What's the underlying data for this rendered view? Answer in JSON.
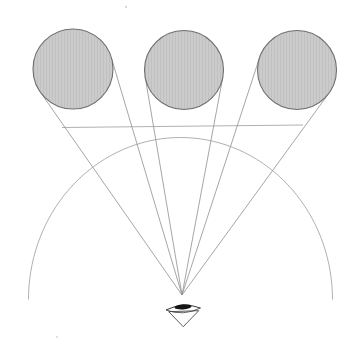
{
  "diagram": {
    "name": "visual-angle-perspective-diagram",
    "canvas": {
      "width": 360,
      "height": 354,
      "background": "#ffffff"
    },
    "colors": {
      "sphere_fill": "#cbcbcb",
      "sphere_texture": "#c1c1c1",
      "sphere_stroke": "#6e6e6e",
      "sight_line": "#8f8f8f",
      "picture_plane_line": "#9c9c9c",
      "arc_line": "#9c9c9c",
      "eye_stroke": "#3a3a3a",
      "cone_stroke": "#4a4a4a",
      "pupil_fill": "#151515",
      "speck": "#d8d8d8"
    },
    "spheres": [
      {
        "cx": 73,
        "cy": 69,
        "r": 40
      },
      {
        "cx": 184,
        "cy": 70,
        "r": 39.5
      },
      {
        "cx": 297,
        "cy": 70,
        "r": 39.5
      }
    ],
    "viewpoint": {
      "x": 182,
      "y": 295
    },
    "sight_lines": [
      {
        "x1": 182,
        "y1": 295,
        "x2": 40.2,
        "y2": 91.9
      },
      {
        "x1": 182,
        "y1": 295,
        "x2": 111.3,
        "y2": 57.6
      },
      {
        "x1": 182,
        "y1": 295,
        "x2": 145.1,
        "y2": 76.6
      },
      {
        "x1": 182,
        "y1": 295,
        "x2": 222.8,
        "y2": 77.3
      },
      {
        "x1": 182,
        "y1": 295,
        "x2": 259.5,
        "y2": 57.8
      },
      {
        "x1": 182,
        "y1": 295,
        "x2": 328.9,
        "y2": 93.2
      }
    ],
    "picture_plane_line": {
      "x1": 62,
      "y1": 127.5,
      "x2": 303,
      "y2": 125
    },
    "vision_arc": {
      "cx": 180.5,
      "cy": 299.5,
      "rx": 152,
      "ry": 162,
      "start_deg": 180,
      "end_deg": 0
    },
    "eye_symbol": {
      "upper_lid": "M 166 310 Q 183 301.5 200.5 308",
      "lower_lid": "M 166 310 Q 183 316.5 200.5 308",
      "pupil": {
        "cx": 183,
        "cy": 306.8,
        "rx": 8.6,
        "ry": 2.6,
        "rotate": -4
      },
      "cone": "M 168.7 311.7 L 198.7 310.7 L 183.3 326.7 Z"
    },
    "specks": [
      {
        "x": 126,
        "y": 7,
        "r": 1.2
      },
      {
        "x": 57,
        "y": 337,
        "r": 1.0
      }
    ]
  }
}
